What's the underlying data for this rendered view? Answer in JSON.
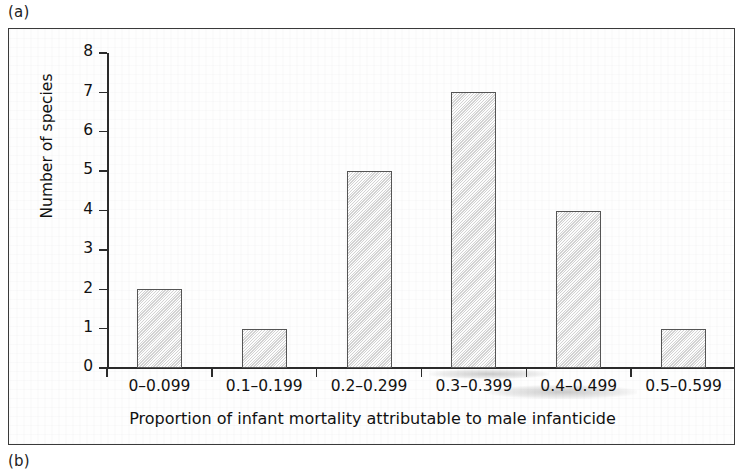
{
  "figure": {
    "panel_a_label": "(a)",
    "panel_b_label": "(b)"
  },
  "chart_data": {
    "type": "bar",
    "title": "",
    "xlabel": "Proportion of infant mortality attributable to male infanticide",
    "ylabel": "Number of species",
    "categories": [
      "0–0.099",
      "0.1–0.199",
      "0.2–0.299",
      "0.3–0.399",
      "0.4–0.499",
      "0.5–0.599"
    ],
    "values": [
      2,
      1,
      5,
      7,
      4,
      1
    ],
    "ylim": [
      0,
      8
    ],
    "yticks": [
      "0",
      "1",
      "2",
      "3",
      "4",
      "5",
      "6",
      "7",
      "8"
    ],
    "ytick_values": [
      0,
      1,
      2,
      3,
      4,
      5,
      6,
      7,
      8
    ],
    "grid": false,
    "legend": null,
    "bar_fill_color": "#ececec",
    "bar_edge_color": "#555555",
    "axis_color": "#2b2b2b"
  }
}
